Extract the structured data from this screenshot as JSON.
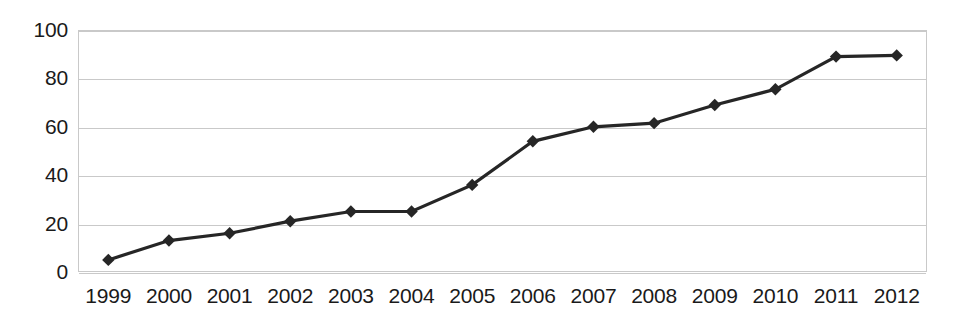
{
  "chart_data": {
    "type": "line",
    "title": "",
    "subtitle": "",
    "xlabel": "",
    "ylabel": "",
    "categories": [
      "1999",
      "2000",
      "2001",
      "2002",
      "2003",
      "2004",
      "2005",
      "2006",
      "2007",
      "2008",
      "2009",
      "2010",
      "2011",
      "2012"
    ],
    "values": [
      5,
      13,
      16,
      21,
      25,
      25,
      36,
      54,
      60,
      61.5,
      69,
      75.5,
      89,
      89.5
    ],
    "series": [
      {
        "name": "",
        "values": [
          5,
          13,
          16,
          21,
          25,
          25,
          36,
          54,
          60,
          61.5,
          69,
          75.5,
          89,
          89.5
        ]
      }
    ],
    "ylim": [
      0,
      100
    ],
    "y_ticks": [
      0,
      20,
      40,
      60,
      80,
      100
    ],
    "y_tick_labels": [
      "0",
      "20",
      "40",
      "60",
      "80",
      "100"
    ],
    "x_tick_labels": [
      "1999",
      "2000",
      "2001",
      "2002",
      "2003",
      "2004",
      "2005",
      "2006",
      "2007",
      "2008",
      "2009",
      "2010",
      "2011",
      "2012"
    ],
    "grid": true,
    "grid_axis": "y",
    "legend": false,
    "legend_position": "none",
    "marker": "diamond",
    "annotations": []
  },
  "style": {
    "series_color": "#262626",
    "grid_color": "#c9c9c9",
    "axis_border_color": "#c9c9c9",
    "tick_label_color": "#1a1a1a",
    "background": "#ffffff"
  }
}
